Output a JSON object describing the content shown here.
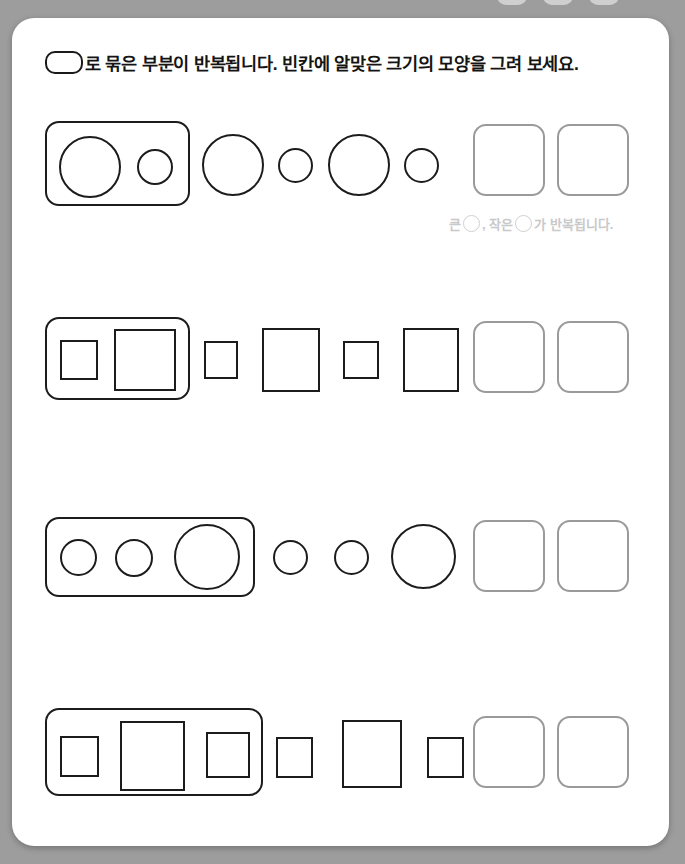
{
  "page": {
    "background_color": "#9d9d9d",
    "sheet_color": "#ffffff",
    "ink_color": "#1c1c1c",
    "answer_box_color": "#9a9a9a",
    "hint_color": "#c9c9c9"
  },
  "instruction": {
    "pill_icon": "rounded-rectangle-glyph",
    "text": "로 묶은 부분이 반복됩니다. 빈칸에 알맞은 크기의 모양을 그려 보세요."
  },
  "hint": {
    "prefix": "큰",
    "middle": ", 작은",
    "suffix": "가 반복됩니다.",
    "circle_icon": "circle-outline-icon"
  },
  "rows": [
    {
      "id": "row-1",
      "shape_type": "circle",
      "group_label": "큰 원, 작은 원 묶음",
      "group_shapes": [
        "large",
        "small"
      ],
      "sequence_shapes": [
        "large",
        "small",
        "large",
        "small"
      ],
      "answer_slots": 2,
      "has_hint": true
    },
    {
      "id": "row-2",
      "shape_type": "square",
      "group_label": "작은 사각형, 큰 사각형 묶음",
      "group_shapes": [
        "small",
        "large"
      ],
      "sequence_shapes": [
        "small",
        "large",
        "small",
        "large"
      ],
      "answer_slots": 2,
      "has_hint": false
    },
    {
      "id": "row-3",
      "shape_type": "circle",
      "group_label": "작은 원, 작은 원, 큰 원 묶음",
      "group_shapes": [
        "small",
        "small",
        "large"
      ],
      "sequence_shapes": [
        "small",
        "small",
        "large"
      ],
      "answer_slots": 2,
      "has_hint": false
    },
    {
      "id": "row-4",
      "shape_type": "square",
      "group_label": "작은 사각형, 큰 사각형, 작은 사각형 묶음",
      "group_shapes": [
        "small",
        "large",
        "medium"
      ],
      "sequence_shapes": [
        "small",
        "large",
        "small"
      ],
      "answer_slots": 2,
      "has_hint": false
    }
  ]
}
